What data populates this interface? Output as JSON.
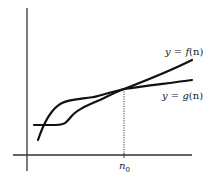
{
  "diagram": {
    "type": "function-comparison",
    "axes": {
      "color": "#333333"
    },
    "curves": [
      {
        "id": "f",
        "label": "y = f(n)",
        "label_prefix": "y = ",
        "func": "f",
        "arg": "(n)"
      },
      {
        "id": "g",
        "label": "y = g(n)",
        "label_prefix": "y = ",
        "func": "g",
        "arg": "(n)"
      }
    ],
    "marker": {
      "label_base": "n",
      "label_sub": "0",
      "label": "n0"
    },
    "stroke_color": "#111111"
  }
}
